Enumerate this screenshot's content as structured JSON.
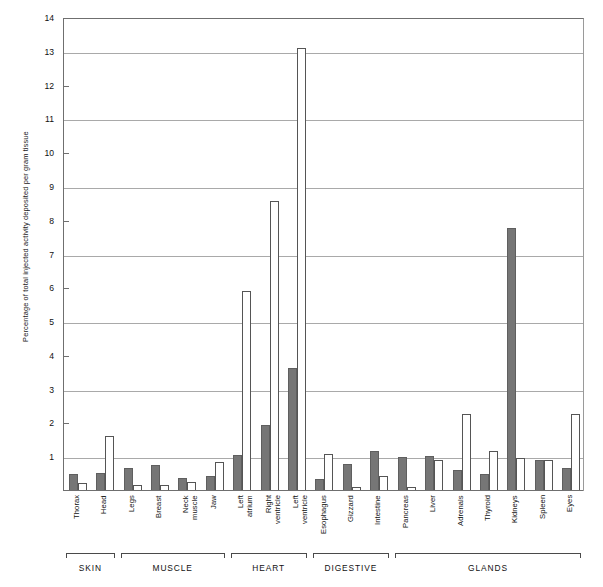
{
  "top_caption": "",
  "chart_data": {
    "type": "bar",
    "title": "",
    "xlabel": "",
    "ylabel": "Percentage of total injected activity deposited per gram tissue",
    "ylim": [
      0,
      14
    ],
    "yticks": [
      1,
      2,
      3,
      4,
      5,
      6,
      7,
      8,
      9,
      10,
      11,
      12,
      13,
      14
    ],
    "gridlines": [
      1,
      3,
      5,
      7,
      9,
      11,
      13,
      14
    ],
    "grid": true,
    "legend": [],
    "legend_position": "none",
    "categories": [
      "Thorax",
      "Head",
      "Legs",
      "Breast",
      "Neck\nmuscle",
      "Jaw",
      "Left\natrium",
      "Right\nventricle",
      "Left\nventricle",
      "Esophagus",
      "Gizzard",
      "Intestine",
      "Pancreas",
      "Liver",
      "Adrenals",
      "Thyroid",
      "Kidneys",
      "Spleen",
      "Eyes"
    ],
    "series": [
      {
        "name": "filled",
        "color": "#767676",
        "values": [
          0.5,
          0.52,
          0.68,
          0.78,
          0.38,
          0.43,
          1.08,
          1.96,
          3.65,
          0.37,
          0.79,
          1.19,
          1.02,
          1.05,
          0.62,
          0.5,
          7.78,
          0.92,
          0.68
        ]
      },
      {
        "name": "open",
        "color": "#ffffff",
        "values": [
          0.23,
          1.63,
          0.18,
          0.17,
          0.28,
          0.86,
          5.93,
          8.58,
          13.1,
          1.1,
          0.13,
          0.45,
          0.12,
          0.93,
          2.27,
          1.18,
          0.97,
          0.93,
          2.27
        ]
      }
    ],
    "groups": [
      {
        "label": "SKIN",
        "from": 0,
        "to": 1
      },
      {
        "label": "MUSCLE",
        "from": 2,
        "to": 5
      },
      {
        "label": "HEART",
        "from": 6,
        "to": 8
      },
      {
        "label": "DIGESTIVE",
        "from": 9,
        "to": 11
      },
      {
        "label": "GLANDS",
        "from": 12,
        "to": 18
      }
    ]
  }
}
